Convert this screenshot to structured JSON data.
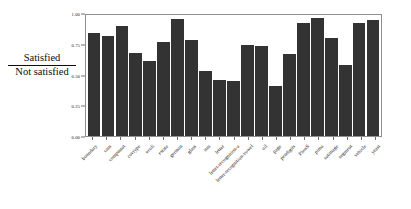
{
  "chart_data": {
    "type": "bar",
    "title": "",
    "xlabel": "",
    "ylabel": "Satisfied / Not satisfied",
    "ylabel_numerator": "Satisfied",
    "ylabel_denominator": "Not satisfied",
    "ylim": [
      0.0,
      1.0
    ],
    "yticks": [
      "0.00",
      "0.25",
      "0.50",
      "0.75",
      "1.00"
    ],
    "ytick_values": [
      0.0,
      0.25,
      0.5,
      0.75,
      1.0
    ],
    "grid": false,
    "legend": null,
    "bar_color": "#333333",
    "frame_color": "#8f8f8f",
    "categories": [
      "boundary",
      "cam",
      "compustat",
      "covtype",
      "ecoli",
      "estate",
      "german",
      "glass",
      "ism",
      "letter",
      "letter-recognition-a",
      "letter-recognition-vowel",
      "oil",
      "page",
      "pendigits",
      "PhosS",
      "pima",
      "satimage",
      "segment",
      "vehicle",
      "yeast"
    ],
    "values": [
      0.85,
      0.83,
      0.91,
      0.69,
      0.62,
      0.78,
      0.97,
      0.79,
      0.54,
      0.46,
      0.455,
      0.755,
      0.745,
      0.41,
      0.675,
      0.935,
      0.975,
      0.81,
      0.585,
      0.935,
      0.955
    ]
  }
}
